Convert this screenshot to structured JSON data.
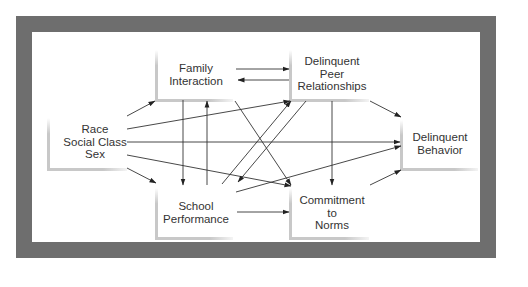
{
  "diagram": {
    "type": "path-model",
    "colors": {
      "frame": "#6e6e6e",
      "background": "#ffffff",
      "bracket": "#c8c8c8",
      "line": "#333333",
      "text": "#333333"
    },
    "nodes": [
      {
        "id": "race",
        "lines": [
          "Race",
          "Social Class",
          "Sex"
        ]
      },
      {
        "id": "family",
        "lines": [
          "Family",
          "Interaction"
        ]
      },
      {
        "id": "peer",
        "lines": [
          "Delinquent",
          "Peer",
          "Relationships"
        ]
      },
      {
        "id": "behavior",
        "lines": [
          "Delinquent",
          "Behavior"
        ]
      },
      {
        "id": "school",
        "lines": [
          "School",
          "Performance"
        ]
      },
      {
        "id": "commitment",
        "lines": [
          "Commitment",
          "to",
          "Norms"
        ]
      }
    ],
    "edges": [
      {
        "from": "race",
        "to": "family"
      },
      {
        "from": "race",
        "to": "peer"
      },
      {
        "from": "race",
        "to": "behavior"
      },
      {
        "from": "race",
        "to": "commitment"
      },
      {
        "from": "race",
        "to": "school"
      },
      {
        "from": "family",
        "to": "peer"
      },
      {
        "from": "peer",
        "to": "family"
      },
      {
        "from": "family",
        "to": "school"
      },
      {
        "from": "school",
        "to": "family"
      },
      {
        "from": "family",
        "to": "commitment"
      },
      {
        "from": "peer",
        "to": "behavior"
      },
      {
        "from": "peer",
        "to": "commitment"
      },
      {
        "from": "peer",
        "to": "school"
      },
      {
        "from": "school",
        "to": "peer"
      },
      {
        "from": "school",
        "to": "behavior"
      },
      {
        "from": "school",
        "to": "commitment"
      },
      {
        "from": "commitment",
        "to": "behavior"
      }
    ]
  }
}
